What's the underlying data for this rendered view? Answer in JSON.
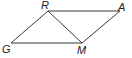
{
  "diagram": {
    "type": "parallelogram",
    "colors": {
      "line": "#3a3a3a",
      "label": "#222222",
      "background": "#ffffff"
    },
    "vertices": [
      {
        "name": "R",
        "x": 48,
        "y": 11,
        "label_x": 41,
        "label_y": 9
      },
      {
        "name": "A",
        "x": 120,
        "y": 11,
        "label_x": 118,
        "label_y": 11
      },
      {
        "name": "G",
        "x": 11,
        "y": 43,
        "label_x": 2,
        "label_y": 53
      },
      {
        "name": "M",
        "x": 82,
        "y": 43,
        "label_x": 77,
        "label_y": 54
      }
    ],
    "segments": [
      {
        "from": "G",
        "to": "R"
      },
      {
        "from": "R",
        "to": "A"
      },
      {
        "from": "A",
        "to": "M"
      },
      {
        "from": "M",
        "to": "G"
      },
      {
        "from": "R",
        "to": "M"
      }
    ],
    "labels": {
      "R": "R",
      "A": "A",
      "G": "G",
      "M": "M"
    }
  }
}
